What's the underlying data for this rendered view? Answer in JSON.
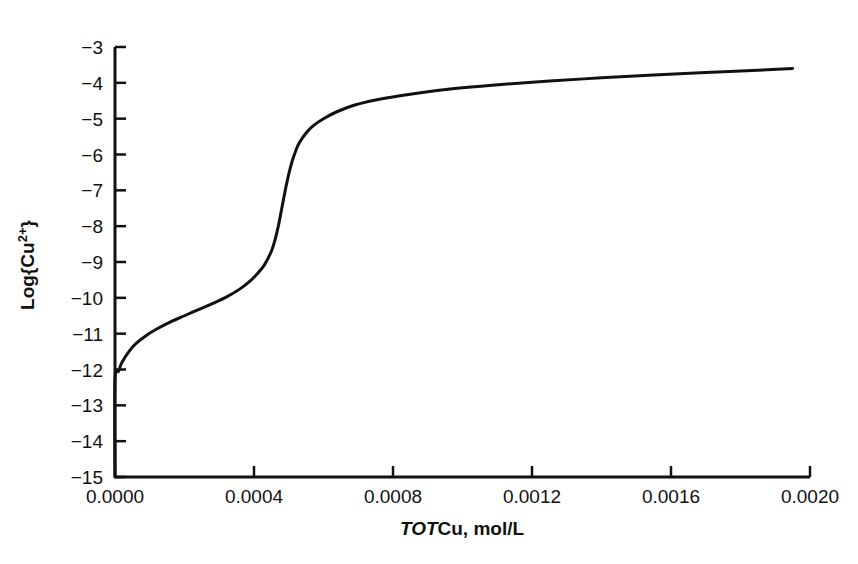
{
  "chart_data": {
    "type": "line",
    "title": "",
    "subtitle": "",
    "xlabel": "TOTCu, mol/L",
    "xlabel_italic_part": "TOT",
    "xlabel_roman_part": "Cu, mol/L",
    "ylabel": "Log{Cu2+}",
    "ylabel_base": "Log{Cu",
    "ylabel_superscript": "2+",
    "ylabel_tail": "}",
    "xlim": [
      0.0,
      0.002
    ],
    "ylim": [
      -15,
      -3
    ],
    "grid": false,
    "legend": null,
    "legend_position": "none",
    "line_color": "#111111",
    "line_width_px": 3,
    "axis_color": "#111111",
    "background_color": "#ffffff",
    "xticks": [
      0.0,
      0.0004,
      0.0008,
      0.0012,
      0.0016,
      0.002
    ],
    "xtick_labels": [
      "0.0000",
      "0.0004",
      "0.0008",
      "0.0012",
      "0.0016",
      "0.0020"
    ],
    "yticks": [
      -3,
      -4,
      -5,
      -6,
      -7,
      -8,
      -9,
      -10,
      -11,
      -12,
      -13,
      -14,
      -15
    ],
    "ytick_labels": [
      "−3",
      "−4",
      "−5",
      "−6",
      "−7",
      "−8",
      "−9",
      "−10",
      "−11",
      "−12",
      "−13",
      "−14",
      "−15"
    ],
    "tick_direction": "in",
    "spines": [
      "left",
      "bottom"
    ],
    "series": [
      {
        "name": "Log{Cu2+} titration curve",
        "x": [
          0.0,
          0.0,
          1e-05,
          2e-05,
          4e-05,
          6e-05,
          9e-05,
          0.00012,
          0.00016,
          0.0002,
          0.00024,
          0.00028,
          0.00032,
          0.00036,
          0.00039,
          0.00041,
          0.00043,
          0.00045,
          0.00046,
          0.00047,
          0.00048,
          0.00049,
          0.0005,
          0.00051,
          0.00052,
          0.00053,
          0.00055,
          0.00057,
          0.0006,
          0.00064,
          0.00069,
          0.00075,
          0.00082,
          0.0009,
          0.001,
          0.00112,
          0.00125,
          0.0014,
          0.00155,
          0.0017,
          0.00185,
          0.00195
        ],
        "y": [
          -15.0,
          -12.3,
          -12.05,
          -11.8,
          -11.5,
          -11.28,
          -11.05,
          -10.87,
          -10.67,
          -10.5,
          -10.33,
          -10.16,
          -9.98,
          -9.75,
          -9.52,
          -9.32,
          -9.08,
          -8.7,
          -8.4,
          -8.0,
          -7.5,
          -7.0,
          -6.55,
          -6.18,
          -5.9,
          -5.68,
          -5.4,
          -5.2,
          -5.0,
          -4.8,
          -4.62,
          -4.48,
          -4.36,
          -4.25,
          -4.14,
          -4.04,
          -3.95,
          -3.86,
          -3.78,
          -3.71,
          -3.65,
          -3.6
        ]
      }
    ],
    "annotations": []
  },
  "figure": {
    "plot_area_px": {
      "left": 115,
      "right": 810,
      "top": 47,
      "bottom": 477
    }
  }
}
